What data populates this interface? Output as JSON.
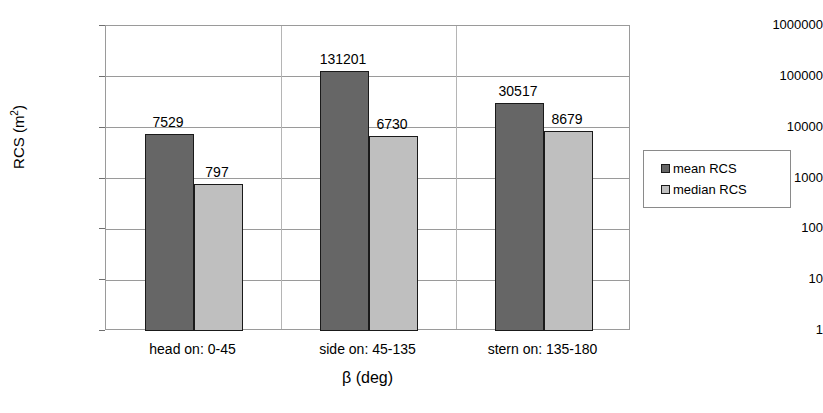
{
  "chart_data": {
    "type": "bar",
    "title": "",
    "xlabel": "β (deg)",
    "ylabel": "RCS (m2)",
    "ylabel_base": "RCS (m",
    "ylabel_sup": "2",
    "ylabel_tail": ")",
    "categories": [
      "head on:  0-45",
      "side on: 45-135",
      "stern on: 135-180"
    ],
    "series": [
      {
        "name": "mean RCS",
        "color": "#666666",
        "values": [
          7529,
          131201,
          30517
        ]
      },
      {
        "name": "median RCS",
        "color": "#bfbfbf",
        "values": [
          797,
          6730,
          8679
        ]
      }
    ],
    "yscale": "log",
    "ylim": [
      1,
      1000000
    ],
    "yticks": [
      1000000,
      100000,
      10000,
      1000,
      100,
      10,
      1
    ],
    "ytick_labels": [
      "1000000",
      "100000",
      "10000",
      "1000",
      "100",
      "10",
      "1"
    ],
    "grid": "horizontal+category-separators",
    "legend_position": "right",
    "data_labels": [
      {
        "text": "7529",
        "series": "mean RCS",
        "category": "head on:  0-45"
      },
      {
        "text": "797",
        "series": "median RCS",
        "category": "head on:  0-45"
      },
      {
        "text": "131201",
        "series": "mean RCS",
        "category": "side on: 45-135"
      },
      {
        "text": "6730",
        "series": "median RCS",
        "category": "side on: 45-135"
      },
      {
        "text": "30517",
        "series": "mean RCS",
        "category": "stern on: 135-180"
      },
      {
        "text": "8679",
        "series": "median RCS",
        "category": "stern on: 135-180"
      }
    ]
  },
  "legend": {
    "entries": [
      {
        "label": "mean RCS"
      },
      {
        "label": "median RCS"
      }
    ]
  }
}
